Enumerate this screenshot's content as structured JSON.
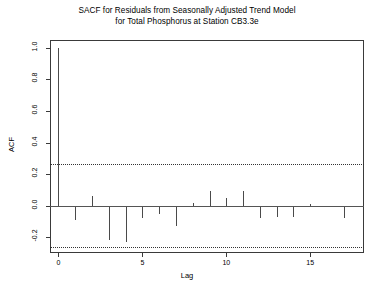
{
  "chart_data": {
    "type": "bar",
    "title": "SACF for Residuals from Seasonally Adjusted Trend Model for Total Phosphorus at Station CB3.3e",
    "title_lines": [
      "SACF for Residuals from Seasonally Adjusted Trend Model",
      "for Total Phosphorus at Station CB3.3e"
    ],
    "xlabel": "Lag",
    "ylabel": "ACF",
    "xlim": [
      -0.5,
      18.2
    ],
    "ylim": [
      -0.3,
      1.05
    ],
    "grid": false,
    "legend": null,
    "x": [
      0,
      1,
      2,
      3,
      4,
      5,
      6,
      7,
      8,
      9,
      10,
      11,
      12,
      13,
      14,
      15,
      16,
      17
    ],
    "categories": [
      "0",
      "1",
      "2",
      "3",
      "4",
      "5",
      "6",
      "7",
      "8",
      "9",
      "10",
      "11",
      "12",
      "13",
      "14",
      "15",
      "16",
      "17"
    ],
    "values": [
      1.0,
      -0.09,
      0.06,
      -0.22,
      -0.23,
      -0.08,
      -0.05,
      -0.13,
      0.02,
      0.09,
      0.05,
      0.09,
      -0.08,
      -0.07,
      -0.07,
      0.01,
      -0.01,
      -0.08
    ],
    "xticks": [
      0,
      5,
      10,
      15
    ],
    "xtick_labels": [
      "0",
      "5",
      "10",
      "15"
    ],
    "yticks": [
      -0.2,
      0.0,
      0.2,
      0.4,
      0.6,
      0.8,
      1.0
    ],
    "ytick_labels": [
      "-0.2",
      "0.0",
      "0.2",
      "0.4",
      "0.6",
      "0.8",
      "1.0"
    ],
    "zero_line": 0.0,
    "confidence_bands": [
      0.265,
      -0.265
    ],
    "confidence_style": "dotted",
    "series_color": "#4a4a4a",
    "axis_color": "#3a3a3a",
    "background_color": "#ffffff"
  }
}
